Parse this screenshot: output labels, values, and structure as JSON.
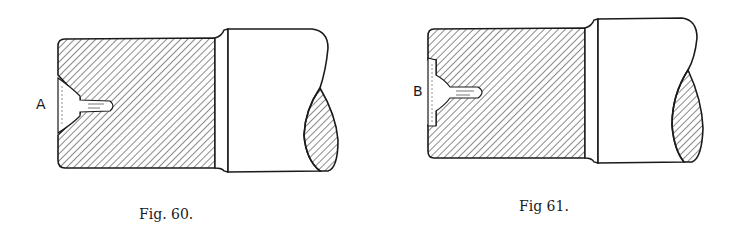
{
  "figures": [
    {
      "id": "fig-60",
      "caption": "Fig. 60.",
      "label": "A",
      "colors": {
        "ink": "#1a1a1a",
        "paper": "#ffffff"
      }
    },
    {
      "id": "fig-61",
      "caption": "Fig 61.",
      "label": "B",
      "colors": {
        "ink": "#1a1a1a",
        "paper": "#ffffff"
      }
    }
  ]
}
